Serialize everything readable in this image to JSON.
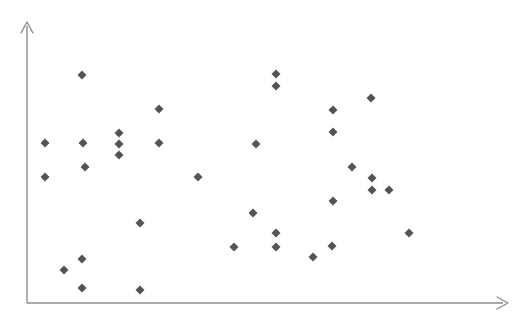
{
  "chart_data": {
    "type": "scatter",
    "title": "",
    "subtitle": "",
    "xlabel": "",
    "ylabel": "",
    "grid": false,
    "legend": null,
    "legend_position": "none",
    "xlim": [
      0,
      100
    ],
    "ylim": [
      0,
      100
    ],
    "x_tick_labels": [],
    "y_tick_labels": [],
    "annotations": [],
    "marker": {
      "shape": "diamond",
      "color": "#545454",
      "size_px": 9
    },
    "axis": {
      "color": "#8c8c8c",
      "style": "two-spine-arrow",
      "x_axis_y_px": 303,
      "y_axis_x_px": 27,
      "x_axis_end_px": 508,
      "y_axis_top_px": 22
    },
    "series": [
      {
        "name": "series-1",
        "n": 41,
        "points_px": [
          [
            82,
            75
          ],
          [
            276,
            74
          ],
          [
            276,
            86
          ],
          [
            371,
            98
          ],
          [
            159,
            109
          ],
          [
            333,
            110
          ],
          [
            45,
            143
          ],
          [
            83,
            143
          ],
          [
            119,
            133
          ],
          [
            119,
            144
          ],
          [
            119,
            155
          ],
          [
            159,
            143
          ],
          [
            256,
            144
          ],
          [
            333,
            132
          ],
          [
            45,
            177
          ],
          [
            85,
            167
          ],
          [
            198,
            177
          ],
          [
            352,
            167
          ],
          [
            372,
            178
          ],
          [
            372,
            190
          ],
          [
            389,
            190
          ],
          [
            140,
            223
          ],
          [
            253,
            213
          ],
          [
            333,
            201
          ],
          [
            276,
            233
          ],
          [
            234,
            247
          ],
          [
            276,
            247
          ],
          [
            332,
            246
          ],
          [
            313,
            257
          ],
          [
            409,
            233
          ],
          [
            82,
            259
          ],
          [
            64,
            270
          ],
          [
            82,
            288
          ],
          [
            140,
            290
          ]
        ],
        "points_data": [
          [
            11.4,
            74.9
          ],
          [
            51.8,
            75.3
          ],
          [
            51.8,
            71.0
          ],
          [
            71.6,
            66.8
          ],
          [
            27.4,
            62.9
          ],
          [
            63.7,
            62.6
          ],
          [
            3.7,
            51.0
          ],
          [
            11.6,
            51.0
          ],
          [
            19.1,
            54.6
          ],
          [
            19.1,
            50.6
          ],
          [
            19.1,
            46.7
          ],
          [
            27.4,
            51.0
          ],
          [
            47.6,
            50.6
          ],
          [
            63.7,
            60.7
          ],
          [
            3.7,
            38.9
          ],
          [
            12.1,
            42.5
          ],
          [
            35.6,
            38.9
          ],
          [
            67.6,
            42.5
          ],
          [
            71.7,
            38.5
          ],
          [
            71.7,
            34.2
          ],
          [
            75.3,
            34.2
          ],
          [
            23.5,
            22.2
          ],
          [
            47.0,
            25.6
          ],
          [
            63.7,
            29.6
          ],
          [
            51.8,
            22.4
          ],
          [
            43.0,
            17.4
          ],
          [
            51.8,
            17.4
          ],
          [
            63.5,
            17.7
          ],
          [
            59.5,
            13.7
          ],
          [
            79.4,
            22.4
          ],
          [
            11.4,
            13.0
          ],
          [
            7.7,
            9.0
          ],
          [
            11.4,
            2.5
          ],
          [
            23.5,
            1.8
          ]
        ]
      }
    ]
  },
  "figure": {
    "background_color": "#ffffff",
    "width_px": 529,
    "height_px": 325
  }
}
